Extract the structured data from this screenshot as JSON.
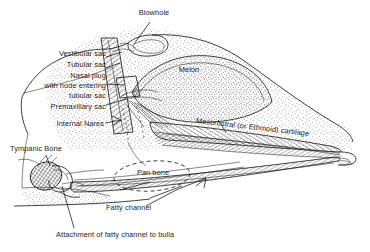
{
  "figure": {
    "type": "anatomical-cross-section",
    "orientation": "lateral view, rostrum pointing right",
    "background_color": "#ffffff",
    "line_color": "#111111",
    "text_color": "#1c1c1c"
  },
  "labels": {
    "blowhole": "Blowhole",
    "vestibular_sac": "Vestibular sac",
    "tubular_sac": "Tubular sac",
    "nasal_plug_1": "Nasal plug",
    "nasal_plug_2": "with node entering",
    "nasal_plug_3": "tubular sac",
    "premaxillary_sac": "Premaxillary sac",
    "internal_nares": "Internal Nares",
    "melon": "Melon",
    "mesorostral": "Mesorostral (or Ethmoid) cartilage",
    "tympanic_bone": "Tympanic Bone",
    "pan_bone": "Pan bone",
    "fatty_channel": "Fatty channel",
    "attachment": "Attachment of fatty channel to bulla"
  },
  "structures": [
    {
      "name": "head-outline",
      "style": "solid contour"
    },
    {
      "name": "melon",
      "style": "stippled lens-shaped body"
    },
    {
      "name": "nasal-passage",
      "style": "hatched diagonal band"
    },
    {
      "name": "blowhole-sac",
      "style": "closed loop at dorsal surface"
    },
    {
      "name": "upper-jaw-rostrum",
      "style": "hatched tapering band"
    },
    {
      "name": "lower-jaw-mandible",
      "style": "hatched tapering band"
    },
    {
      "name": "pan-bone-region",
      "style": "dashed ellipse"
    },
    {
      "name": "tympanic-bulla",
      "style": "cross-hatched rounded mass"
    },
    {
      "name": "tissue-stipple",
      "style": "dotted fill"
    }
  ]
}
